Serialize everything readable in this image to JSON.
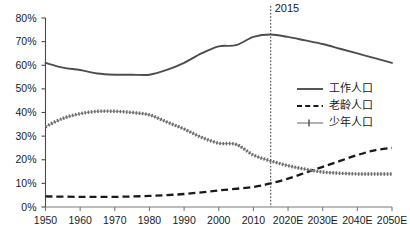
{
  "chart_data": {
    "type": "line",
    "title": "",
    "xlabel": "",
    "ylabel": "",
    "xlim": [
      1950,
      2050
    ],
    "ylim": [
      0,
      0.8
    ],
    "grid": false,
    "legend_position": "right",
    "x": [
      1950,
      1960,
      1970,
      1980,
      1990,
      2000,
      2010,
      2020,
      2030,
      2040,
      2050
    ],
    "xtick_labels": [
      "1950",
      "1960",
      "1970",
      "1980",
      "1990",
      "2000",
      "2010",
      "2020E",
      "2030E",
      "2040E",
      "2050E"
    ],
    "ytick_labels": [
      "0%",
      "10%",
      "20%",
      "30%",
      "40%",
      "50%",
      "60%",
      "70%",
      "80%"
    ],
    "ytick_values": [
      0,
      10,
      20,
      30,
      40,
      50,
      60,
      70,
      80
    ],
    "series": [
      {
        "name": "工作人口",
        "style": "solid",
        "color": "#4d4d4d",
        "values": [
          61,
          58,
          56,
          56,
          61,
          68,
          72,
          72,
          69,
          65,
          61
        ],
        "points": [
          [
            1950,
            61
          ],
          [
            1955,
            59
          ],
          [
            1960,
            58
          ],
          [
            1965,
            56.5
          ],
          [
            1970,
            56
          ],
          [
            1975,
            56
          ],
          [
            1980,
            56
          ],
          [
            1985,
            58
          ],
          [
            1990,
            61
          ],
          [
            1995,
            65
          ],
          [
            2000,
            68
          ],
          [
            2005,
            68.5
          ],
          [
            2010,
            72
          ],
          [
            2015,
            73
          ],
          [
            2020,
            72
          ],
          [
            2025,
            70.5
          ],
          [
            2030,
            69
          ],
          [
            2035,
            67
          ],
          [
            2040,
            65
          ],
          [
            2045,
            63
          ],
          [
            2050,
            61
          ]
        ]
      },
      {
        "name": "老龄人口",
        "style": "dashed",
        "color": "#1a1a1a",
        "values": [
          4.5,
          4.3,
          4.3,
          4.7,
          5.5,
          7,
          8.5,
          12,
          17,
          22,
          25
        ],
        "points": [
          [
            1950,
            4.5
          ],
          [
            1960,
            4.3
          ],
          [
            1970,
            4.3
          ],
          [
            1980,
            4.7
          ],
          [
            1990,
            5.5
          ],
          [
            2000,
            7
          ],
          [
            2010,
            8.5
          ],
          [
            2015,
            10
          ],
          [
            2020,
            12
          ],
          [
            2025,
            14.5
          ],
          [
            2030,
            17
          ],
          [
            2035,
            19.5
          ],
          [
            2040,
            22
          ],
          [
            2045,
            24
          ],
          [
            2050,
            25
          ]
        ]
      },
      {
        "name": "少年人口",
        "style": "dotted",
        "color": "#6b6b6b",
        "values": [
          34,
          39.5,
          40.5,
          39,
          33,
          27,
          19,
          16,
          14.5,
          14,
          14
        ],
        "points": [
          [
            1950,
            34
          ],
          [
            1955,
            37.5
          ],
          [
            1960,
            39.5
          ],
          [
            1965,
            40.5
          ],
          [
            1970,
            40.5
          ],
          [
            1975,
            40
          ],
          [
            1980,
            39
          ],
          [
            1985,
            36
          ],
          [
            1990,
            33
          ],
          [
            1995,
            29.5
          ],
          [
            2000,
            27
          ],
          [
            2005,
            26.5
          ],
          [
            2010,
            22
          ],
          [
            2015,
            19.5
          ],
          [
            2020,
            17.5
          ],
          [
            2025,
            16
          ],
          [
            2030,
            14.8
          ],
          [
            2035,
            14.3
          ],
          [
            2040,
            14
          ],
          [
            2045,
            14
          ],
          [
            2050,
            14
          ]
        ]
      }
    ],
    "annotations": [
      {
        "name": "marker-2015",
        "label": "2015",
        "x": 2015,
        "style": "vertical-dotted-line"
      }
    ]
  },
  "legend": {
    "items": [
      {
        "label": "工作人口",
        "style": "solid"
      },
      {
        "label": "老龄人口",
        "style": "dashed"
      },
      {
        "label": "少年人口",
        "style": "dotted-marker"
      }
    ]
  }
}
